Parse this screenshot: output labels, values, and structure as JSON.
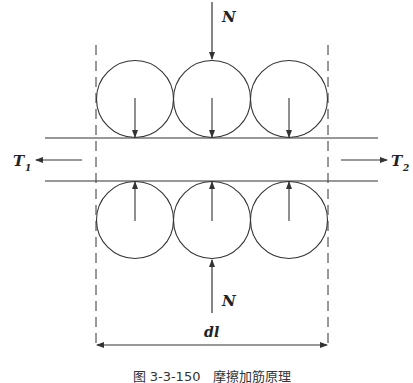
{
  "diagram": {
    "labels": {
      "normal_force_top": "N",
      "normal_force_bottom": "N",
      "tension_left": "T",
      "tension_left_sub": "1",
      "tension_right": "T",
      "tension_right_sub": "2",
      "length": "d",
      "length_var": "l"
    },
    "caption": "图 3-3-150　摩擦加筋原理",
    "colors": {
      "stroke": "#333333",
      "background": "#ffffff"
    }
  }
}
